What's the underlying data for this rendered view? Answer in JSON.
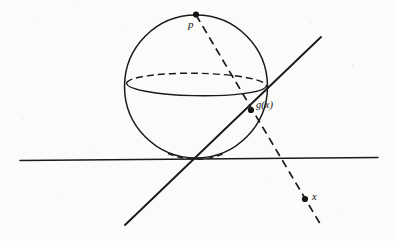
{
  "figure": {
    "kind": "stereographic-projection-diagram",
    "caption": "",
    "canvas": {
      "width": 396,
      "height": 241
    },
    "colors": {
      "background": "#fbfbf9",
      "ink": "#1a1a1a",
      "dot": "#141414",
      "plane_line": "#3a3a3a"
    }
  },
  "labels": {
    "pole": "p",
    "projected_point": "g(x)",
    "plane_point": "x"
  },
  "points": {
    "pole": {
      "name": "p",
      "cx": 196,
      "cy": 14.5,
      "r": 3.1,
      "label_x": 188,
      "label_y": 28,
      "label_size": 11
    },
    "projected_point": {
      "name": "g(x)",
      "cx": 251,
      "cy": 110,
      "r": 3.1,
      "label_x": 256,
      "label_y": 108,
      "label_size": 10.5
    },
    "plane_point": {
      "name": "x",
      "cx": 305,
      "cy": 199,
      "r": 3.1,
      "label_x": 312,
      "label_y": 200,
      "label_size": 10.5
    }
  },
  "geometry": {
    "sphere": {
      "cx": 196,
      "cy": 86.5,
      "r": 71.5,
      "stroke_width": 1.5
    },
    "equator": {
      "cx": 196.5,
      "cy": 84.5,
      "rx": 70,
      "ry": 11.5,
      "rotation_deg": 1.0,
      "front_path": "M 126.6 82.8 A 70 11.5 1 0 0 266.4 86.2",
      "back_path": "M 126.6 82.8 A 70 11.5 1 0 1 266.4 86.2",
      "stroke_width": 1.4,
      "dash_pattern": "7 4"
    },
    "plane_line": {
      "x1": 20,
      "y1": 160.5,
      "x2": 378,
      "y2": 157.5,
      "stroke_width": 1.4
    },
    "projection_ray": {
      "comment": "dashed ray from pole p through g(x) down to x and beyond",
      "x1": 196,
      "y1": 15,
      "x2": 322,
      "y2": 227,
      "stroke_width": 1.7,
      "dash_pattern": "8 5"
    },
    "tangent_line": {
      "comment": "solid straight line crossing the figure from lower-left to upper-right",
      "x1": 125,
      "y1": 225,
      "x2": 321,
      "y2": 37,
      "stroke_width": 1.9
    },
    "sphere_hidden_base_arc": {
      "comment": "short dashed arc marking the hidden underside near the tangency point",
      "path": "M 168 153.5 A 71.5 71.5 0 0 0 224 153.5",
      "stroke_width": 1.4,
      "dash_pattern": "6 4"
    }
  }
}
